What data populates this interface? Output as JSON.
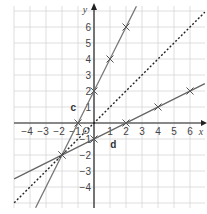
{
  "chart_data": {
    "type": "line",
    "title": "",
    "xlabel": "x",
    "ylabel": "y",
    "xlim": [
      -5,
      7
    ],
    "ylim": [
      -5,
      7
    ],
    "grid": true,
    "x_ticks": [
      "-4",
      "-3",
      "-2",
      "-1",
      "0",
      "1",
      "2",
      "3",
      "4",
      "5",
      "6"
    ],
    "y_ticks": [
      "-4",
      "-3",
      "-2",
      "-1",
      "1",
      "2",
      "3",
      "4",
      "5",
      "6"
    ],
    "origin_label": "O",
    "series": [
      {
        "name": "c",
        "style": "solid",
        "color": "#777777",
        "equation": "y = 2x + 2",
        "points": [
          [
            -2,
            -2
          ],
          [
            -1,
            0
          ],
          [
            0,
            2
          ],
          [
            1,
            4
          ],
          [
            2,
            6
          ]
        ]
      },
      {
        "name": "d",
        "style": "solid",
        "color": "#666666",
        "equation": "y = 0.5x - 1",
        "points": [
          [
            -2,
            -2
          ],
          [
            0,
            -1
          ],
          [
            2,
            0
          ],
          [
            4,
            1
          ],
          [
            6,
            2
          ]
        ]
      },
      {
        "name": "y=x",
        "style": "dotted",
        "color": "#222222",
        "equation": "y = x",
        "points": [
          [
            -5,
            -5
          ],
          [
            7,
            7
          ]
        ]
      }
    ],
    "annotations": [
      {
        "text": "c",
        "x": -1.3,
        "y": 1
      },
      {
        "text": "d",
        "x": 1.2,
        "y": -1.3
      }
    ]
  }
}
